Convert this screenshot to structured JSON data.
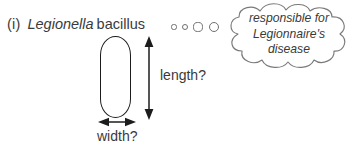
{
  "figure": {
    "item_marker": "(i)",
    "organism_genus": "Legionella",
    "organism_morphology": "bacillus",
    "ink_color": "#2b2b2b",
    "outline_color": "#1c1c1c",
    "background_color": "#ffffff"
  },
  "thought_trail": {
    "name": "thought-trail-dots",
    "count": 4,
    "dots": [
      {
        "cx": 174,
        "cy": 27,
        "r": 2.6
      },
      {
        "cx": 185,
        "cy": 27,
        "r": 3.4
      },
      {
        "cx": 198,
        "cy": 27,
        "r": 4.6
      },
      {
        "cx": 214,
        "cy": 27,
        "r": 5.4
      }
    ]
  },
  "cloud": {
    "name": "thought-bubble",
    "line1": "responsible for",
    "line2": "Legionnaire's",
    "line3": "disease",
    "stroke_color": "#7a7a7a"
  },
  "measurements": {
    "length_label": "length?",
    "width_label": "width?"
  }
}
